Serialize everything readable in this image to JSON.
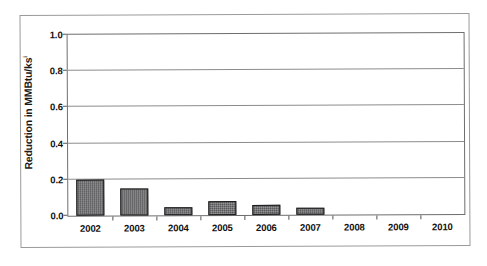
{
  "figure": {
    "background_color": "#ffffff",
    "frame_color": "#9a9a9a",
    "plot_border_color": "#6e6e6e",
    "gridline_color": "#8c8c8c"
  },
  "axis_title": {
    "prefix": "Reduction in ",
    "bold_part": "MMBtu/ks",
    "superscript": "i",
    "full": "Reduction in MMBtu/ksi"
  },
  "chart_data": {
    "type": "bar",
    "title": "",
    "xlabel": "",
    "ylabel": "Reduction in MMBtu/ksi",
    "categories": [
      "2002",
      "2003",
      "2004",
      "2005",
      "2006",
      "2007",
      "2008",
      "2009",
      "2010"
    ],
    "values": [
      0.2,
      0.15,
      0.045,
      0.075,
      0.055,
      0.04,
      0.0,
      0.0,
      0.0
    ],
    "ylim": [
      0.0,
      1.0
    ],
    "ytick_values": [
      0.0,
      0.2,
      0.4,
      0.6,
      0.8,
      1.0
    ],
    "ytick_labels": [
      "0.0",
      "0.2",
      "0.4",
      "0.6",
      "0.8",
      "1.0"
    ],
    "grid": true,
    "grid_axis": "y",
    "legend": false,
    "legend_position": "none",
    "bar_color": "#58585a",
    "bar_edge_color": "#1d1d1d",
    "series": [
      {
        "name": "Reduction",
        "values": [
          0.2,
          0.15,
          0.045,
          0.075,
          0.055,
          0.04,
          0.0,
          0.0,
          0.0
        ]
      }
    ]
  }
}
